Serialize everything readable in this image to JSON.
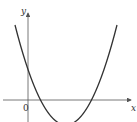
{
  "diagram": {
    "type": "function-graph",
    "axes": {
      "x_label": "x",
      "y_label": "y",
      "origin_label": "0"
    },
    "curve": {
      "kind": "parabola",
      "opens": "up",
      "y_intercept": "positive",
      "x_intercepts": "two positive roots",
      "vertex": "below x-axis, right of y-axis",
      "color": "#333333"
    },
    "colors": {
      "axis": "#555555",
      "curve": "#333333",
      "background": "#ffffff"
    }
  }
}
